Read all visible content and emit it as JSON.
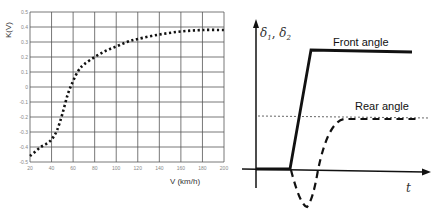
{
  "chart_data": [
    {
      "type": "line",
      "title": "",
      "xlabel": "V (km/h)",
      "ylabel": "K(V)",
      "xlim": [
        20,
        200
      ],
      "ylim": [
        -0.5,
        0.5
      ],
      "grid": true,
      "x_ticks": [
        "20",
        "40",
        "60",
        "80",
        "100",
        "120",
        "140",
        "160",
        "180",
        "200"
      ],
      "y_ticks": [
        "0.5",
        "0.4",
        "0.3",
        "0.2",
        "0.1",
        "0",
        "-0.1",
        "-0.2",
        "-0.3",
        "-0.4",
        "-0.5"
      ],
      "series": [
        {
          "name": "K(V)",
          "style": "dotted",
          "x": [
            20,
            25,
            30,
            35,
            40,
            45,
            50,
            55,
            60,
            65,
            70,
            80,
            90,
            100,
            110,
            120,
            140,
            160,
            180,
            200
          ],
          "y": [
            -0.46,
            -0.43,
            -0.4,
            -0.38,
            -0.35,
            -0.29,
            -0.18,
            -0.05,
            0.04,
            0.11,
            0.15,
            0.2,
            0.24,
            0.27,
            0.3,
            0.32,
            0.35,
            0.37,
            0.38,
            0.38
          ]
        }
      ]
    },
    {
      "type": "line",
      "title": "",
      "xlabel": "t",
      "ylabel": "δ1, δ2",
      "grid": false,
      "annotations": [
        "Front angle",
        "Rear angle"
      ],
      "series": [
        {
          "name": "Front angle",
          "style": "solid",
          "description": "zero, then steep linear ramp up to a constant high level"
        },
        {
          "name": "Rear angle",
          "style": "dashed",
          "description": "initial negative dip below zero, then rises to a constant level lower than the front angle (thin dashed reference line)"
        }
      ]
    }
  ],
  "left_chart": {
    "ylabel": "K(V)",
    "xlabel": "V (km/h)",
    "x_ticks": [
      "20",
      "40",
      "60",
      "80",
      "100",
      "120",
      "140",
      "160",
      "180",
      "200"
    ],
    "y_ticks": [
      "0.5",
      "0.4",
      "0.3",
      "0.2",
      "0.1",
      "0",
      "-0.1",
      "-0.2",
      "-0.3",
      "-0.4",
      "-0.5"
    ]
  },
  "right_chart": {
    "ylabel_delta": "δ",
    "ylabel_sub1": "1",
    "ylabel_sep": ", ",
    "ylabel_sub2": "2",
    "xlabel": "t",
    "front_label": "Front angle",
    "rear_label": "Rear angle"
  }
}
